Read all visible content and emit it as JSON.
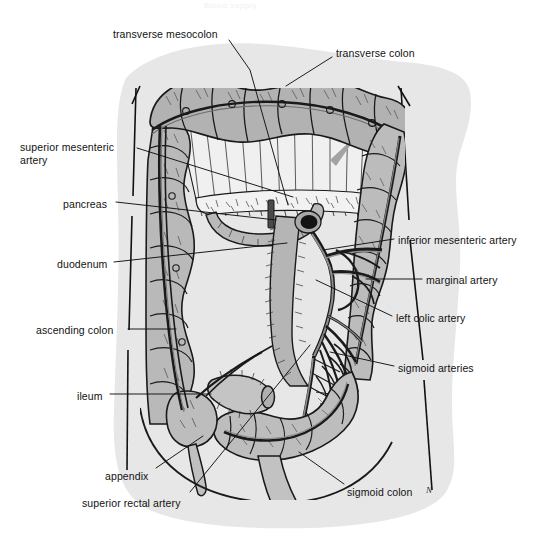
{
  "figure": {
    "ghost_title": "Blood supply",
    "signature": "N",
    "canvas": {
      "width": 533,
      "height": 558
    },
    "colors": {
      "page_background": "#ffffff",
      "paper_blob": "#e6e6e6",
      "bowel_fill": "#b3b3b3",
      "bowel_fill_light": "#cfcfcf",
      "mesentery_fill": "#eeeeee",
      "vessel_fill": "#9a9a9a",
      "ink": "#1a1a1a",
      "label_text": "#121212",
      "arrow_gray": "#9e9e9e"
    }
  },
  "labels": [
    {
      "id": "transverse-mesocolon",
      "text": "transverse mesocolon",
      "x": 113,
      "y": 28,
      "align": "left",
      "leader": [
        [
          229,
          40
        ],
        [
          250,
          70
        ],
        [
          288,
          205
        ]
      ]
    },
    {
      "id": "transverse-colon",
      "text": "transverse colon",
      "x": 336,
      "y": 47,
      "align": "left",
      "leader": [
        [
          332,
          57
        ],
        [
          286,
          86
        ]
      ]
    },
    {
      "id": "superior-mesenteric-artery",
      "text": "superior mesenteric\nartery",
      "x": 20,
      "y": 141,
      "align": "left",
      "leader": [
        [
          137,
          148
        ],
        [
          293,
          197
        ]
      ]
    },
    {
      "id": "pancreas",
      "text": "pancreas",
      "x": 63,
      "y": 198,
      "align": "left",
      "leader": [
        [
          116,
          202
        ],
        [
          276,
          220
        ]
      ]
    },
    {
      "id": "duodenum",
      "text": "duodenum",
      "x": 57,
      "y": 258,
      "align": "left",
      "leader": [
        [
          114,
          262
        ],
        [
          287,
          243
        ]
      ]
    },
    {
      "id": "ascending-colon",
      "text": "ascending colon",
      "x": 36,
      "y": 324,
      "align": "left",
      "leader": [
        [
          128,
          329
        ],
        [
          176,
          329
        ]
      ]
    },
    {
      "id": "ileum",
      "text": "ileum",
      "x": 77,
      "y": 390,
      "align": "left",
      "leader": [
        [
          110,
          394
        ],
        [
          211,
          394
        ]
      ]
    },
    {
      "id": "appendix",
      "text": "appendix",
      "x": 105,
      "y": 470,
      "align": "left",
      "leader": [
        [
          156,
          468
        ],
        [
          203,
          436
        ]
      ]
    },
    {
      "id": "superior-rectal-artery",
      "text": "superior rectal artery",
      "x": 82,
      "y": 497,
      "align": "left",
      "leader": [
        [
          190,
          492
        ],
        [
          310,
          345
        ]
      ]
    },
    {
      "id": "inferior-mesenteric-artery",
      "text": "inferior mesenteric artery",
      "x": 398,
      "y": 234,
      "align": "left",
      "leader": [
        [
          394,
          239
        ],
        [
          323,
          250
        ]
      ]
    },
    {
      "id": "marginal-artery",
      "text": "marginal artery",
      "x": 426,
      "y": 274,
      "align": "left",
      "leader": [
        [
          422,
          279
        ],
        [
          366,
          279
        ]
      ]
    },
    {
      "id": "left-colic-artery",
      "text": "left colic artery",
      "x": 396,
      "y": 312,
      "align": "left",
      "leader": [
        [
          392,
          316
        ],
        [
          316,
          280
        ]
      ]
    },
    {
      "id": "sigmoid-arteries",
      "text": "sigmoid arteries",
      "x": 398,
      "y": 362,
      "align": "left",
      "leader": [
        [
          394,
          366
        ],
        [
          330,
          352
        ]
      ]
    },
    {
      "id": "sigmoid-colon",
      "text": "sigmoid colon",
      "x": 347,
      "y": 486,
      "align": "left",
      "leader": [
        [
          344,
          484
        ],
        [
          299,
          452
        ]
      ]
    }
  ],
  "anatomy": {
    "structures": [
      "transverse colon",
      "transverse mesocolon",
      "ascending colon",
      "descending colon",
      "sigmoid colon",
      "cecum",
      "appendix",
      "ileum",
      "duodenum",
      "pancreas",
      "aorta",
      "superior mesenteric artery",
      "inferior mesenteric artery",
      "marginal artery",
      "left colic artery",
      "sigmoid arteries",
      "superior rectal artery"
    ]
  }
}
